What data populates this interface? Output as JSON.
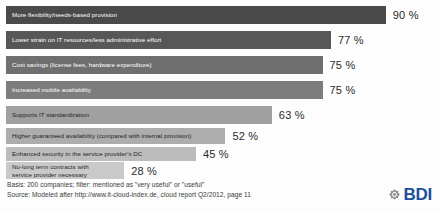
{
  "chart_data": {
    "type": "bar",
    "orientation": "horizontal",
    "title": "",
    "xlabel": "",
    "ylabel": "",
    "xlim": [
      0,
      100
    ],
    "grid": false,
    "legend": "none",
    "value_suffix": "%",
    "categories": [
      "More flexibility/needs-based provision",
      "Lower strain on IT resources/less administrative effort",
      "Cost savings (license fees, hardware expenditure)",
      "Increased mobile availability",
      "Supports IT standardization",
      "Higher guaranteed availability (compared with internal provision)",
      "Enhanced security in the service provider's DC",
      "No-long term contracts with\nservice provider necessary"
    ],
    "values": [
      90,
      77,
      75,
      75,
      63,
      52,
      45,
      28
    ],
    "value_labels": [
      "90 %",
      "77 %",
      "75 %",
      "75 %",
      "63 %",
      "52 %",
      "45 %",
      "28 %"
    ],
    "bar_colors": [
      "#4a4a4a",
      "#575757",
      "#6f6f6f",
      "#7d7d7d",
      "#a0a0a0",
      "#adadad",
      "#bcbcbc",
      "#c9c9c9"
    ],
    "label_colors": [
      "#ffffff",
      "#ffffff",
      "#ffffff",
      "#ffffff",
      "#1f1f1f",
      "#1f1f1f",
      "#1f1f1f",
      "#1f1f1f"
    ]
  },
  "footer": {
    "basis": "Basis: 200 companies; filter: mentioned as \"very useful\" or \"useful\"",
    "source": "Source: Modeled after http://www.it-cloud-index.de, cloud report Q2/2012, page 11"
  },
  "logo": {
    "text": "BDI",
    "mark": "rosette-icon",
    "color": "#1b4f9c"
  }
}
